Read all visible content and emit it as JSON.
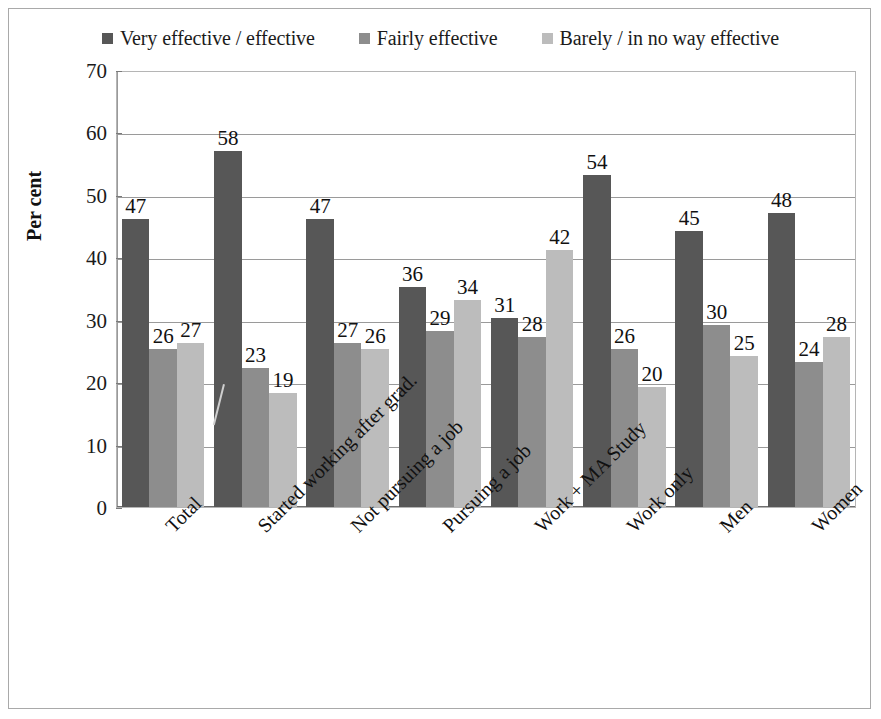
{
  "chart_data": {
    "type": "bar",
    "title": "",
    "subtitle": "",
    "xlabel": "",
    "ylabel": "Per cent",
    "ylim": [
      0,
      70
    ],
    "ytick_step": 10,
    "yticks": [
      0,
      10,
      20,
      30,
      40,
      50,
      60,
      70
    ],
    "grid": true,
    "legend_position": "top-center",
    "categories": [
      "Total",
      "Started working after grad.",
      "Not pursuing a job",
      "Pursuing a job",
      "Work + MA Study",
      "Work only",
      "Men",
      "Women"
    ],
    "series": [
      {
        "name": "Very effective / effective",
        "color": "#575757",
        "values": [
          47,
          58,
          47,
          36,
          31,
          54,
          45,
          48
        ]
      },
      {
        "name": "Fairly effective",
        "color": "#8d8d8d",
        "values": [
          26,
          23,
          27,
          29,
          28,
          26,
          30,
          24
        ]
      },
      {
        "name": "Barely / in no way effective",
        "color": "#bcbcbc",
        "values": [
          27,
          19,
          26,
          34,
          42,
          20,
          25,
          28
        ]
      }
    ]
  },
  "axis": {
    "y_title": "Per cent",
    "y_tick_labels": [
      "70",
      "60",
      "50",
      "40",
      "30",
      "20",
      "10",
      "0"
    ]
  },
  "legend": {
    "items": [
      {
        "label": "Very effective / effective",
        "color": "#575757"
      },
      {
        "label": "Fairly effective",
        "color": "#8d8d8d"
      },
      {
        "label": "Barely / in no way effective",
        "color": "#bcbcbc"
      }
    ]
  }
}
